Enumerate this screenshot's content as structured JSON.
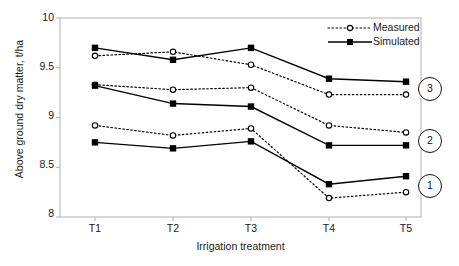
{
  "chart_data": {
    "type": "line",
    "title": "",
    "xlabel": "Irrigation treatment",
    "ylabel": "Above ground dry matter, t/ha",
    "categories": [
      "T1",
      "T2",
      "T3",
      "T4",
      "T5"
    ],
    "ylim": [
      8,
      10
    ],
    "yticks": [
      "8",
      "8.5",
      "9",
      "9.5",
      "10"
    ],
    "grid": false,
    "legend_position": "top-right",
    "legend": [
      "Measured",
      "Simulated"
    ],
    "groups": [
      {
        "label": "3",
        "series": [
          {
            "name": "Measured",
            "style": "dotted-open-circle",
            "values": [
              9.62,
              9.66,
              9.53,
              9.23,
              9.23
            ]
          },
          {
            "name": "Simulated",
            "style": "solid-filled-square",
            "values": [
              9.7,
              9.58,
              9.7,
              9.39,
              9.36
            ]
          }
        ]
      },
      {
        "label": "2",
        "series": [
          {
            "name": "Measured",
            "style": "dotted-open-circle",
            "values": [
              9.33,
              9.28,
              9.3,
              8.92,
              8.85
            ]
          },
          {
            "name": "Simulated",
            "style": "solid-filled-square",
            "values": [
              9.32,
              9.14,
              9.11,
              8.72,
              8.72
            ]
          }
        ]
      },
      {
        "label": "1",
        "series": [
          {
            "name": "Measured",
            "style": "dotted-open-circle",
            "values": [
              8.92,
              8.82,
              8.89,
              8.19,
              8.25
            ]
          },
          {
            "name": "Simulated",
            "style": "solid-filled-square",
            "values": [
              8.75,
              8.69,
              8.76,
              8.33,
              8.41
            ]
          }
        ]
      }
    ],
    "colors": {
      "line": "#000000",
      "marker_fill": "#000000",
      "marker_open": "#ffffff",
      "axis": "#b0b0b0",
      "text": "#1a1a1a"
    }
  },
  "legend": {
    "measured_label": "Measured",
    "simulated_label": "Simulated"
  },
  "axes": {
    "y_title": "Above ground dry matter, t/ha",
    "x_title": "Irrigation treatment",
    "y_ticks": [
      "10",
      "9.5",
      "9",
      "8.5",
      "8"
    ],
    "x_ticks": [
      "T1",
      "T2",
      "T3",
      "T4",
      "T5"
    ]
  },
  "group_labels": [
    "3",
    "2",
    "1"
  ]
}
